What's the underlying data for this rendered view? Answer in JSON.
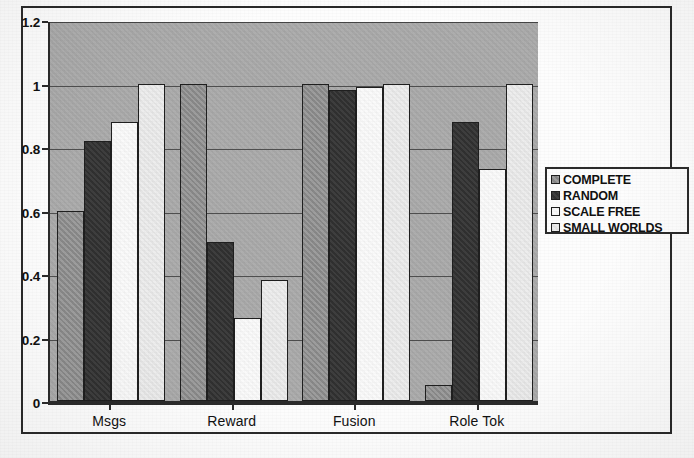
{
  "chart_data": {
    "type": "bar",
    "title": "",
    "xlabel": "",
    "ylabel": "",
    "categories": [
      "Msgs",
      "Reward",
      "Fusion",
      "Role Tok"
    ],
    "series": [
      {
        "name": "COMPLETE",
        "swatch": "#8f8f8f",
        "values": [
          0.6,
          1.0,
          1.0,
          0.05
        ]
      },
      {
        "name": "RANDOM",
        "swatch": "#343434",
        "values": [
          0.82,
          0.5,
          0.98,
          0.88
        ]
      },
      {
        "name": "SCALE FREE",
        "swatch": "#fafafa",
        "values": [
          0.88,
          0.26,
          0.99,
          0.73
        ]
      },
      {
        "name": "SMALL WORLDS",
        "swatch": "#ededed",
        "values": [
          1.0,
          0.38,
          1.0,
          1.0
        ]
      }
    ],
    "ylim": [
      0,
      1.2
    ],
    "yticks": [
      0,
      0.2,
      0.4,
      0.6,
      0.8,
      1,
      1.2
    ],
    "ytick_labels": [
      "0",
      "0.2",
      "0.4",
      "0.6",
      "0.8",
      "1",
      "1.2"
    ],
    "grid": true,
    "legend_position": "right",
    "plot_background": "#a9a9a9"
  }
}
